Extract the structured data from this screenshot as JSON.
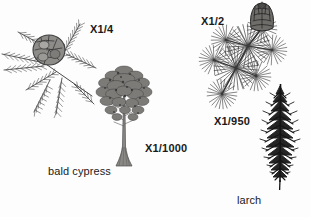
{
  "plate": {
    "background_color": "#fdfdfd",
    "ink_color": "#1a1a1a",
    "width": 310,
    "height": 217
  },
  "figures": {
    "cypress_branch": {
      "name": "bald cypress branch with cone",
      "magnification_label": "X1/4",
      "cone_shape": "globose scaly cone",
      "foliage_shape": "feathery pinnate needle sprays"
    },
    "cypress_tree": {
      "name": "bald cypress whole tree",
      "magnification_label": "X1/1000",
      "crown_shape": "broad rounded crown",
      "trunk_shape": "flared buttressed base"
    },
    "larch_branch": {
      "name": "larch branch with cone",
      "magnification_label": "X1/2",
      "cone_shape": "upright ovoid cone",
      "foliage_shape": "radiating needle rosettes"
    },
    "larch_tree": {
      "name": "larch whole tree",
      "magnification_label": "X1/950",
      "crown_shape": "narrow spire-like conical"
    }
  },
  "captions": {
    "left_species": "bald cypress",
    "right_species": "larch"
  }
}
